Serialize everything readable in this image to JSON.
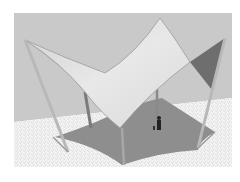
{
  "image": {
    "subject": "tensile shade sail structure 3D rendering",
    "colors": {
      "page_background": "#ffffff",
      "wall": "#c9c9c9",
      "floor": "#f1f1f1",
      "floor_speckle": "#dcdcdc",
      "canopy_light": "#e6e6e6",
      "canopy_mid": "#d4d4d4",
      "canopy_edge": "#9a9a9a",
      "dark_sail": "#6e6e6e",
      "pole": "#b8b8b8",
      "pole_dark": "#7a7a7a",
      "shadow": "#8e8e8e",
      "figure": "#222222"
    }
  }
}
